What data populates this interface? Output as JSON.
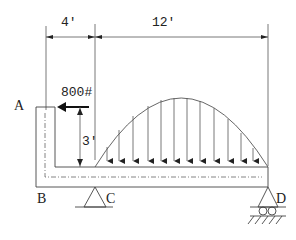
{
  "diagram": {
    "type": "structural-frame-loading",
    "colors": {
      "line": "#333333",
      "background": "#ffffff"
    },
    "dimensions": {
      "left_span": "4'",
      "right_span": "12'",
      "vertical_height": "3'"
    },
    "loads": {
      "point_load": "800#",
      "distributed_load_shape": "parabolic"
    },
    "points": {
      "A": "A",
      "B": "B",
      "C": "C",
      "D": "D"
    },
    "supports": {
      "C": "pin",
      "D": "roller"
    }
  }
}
